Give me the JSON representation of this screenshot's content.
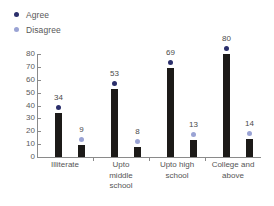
{
  "chart_data": {
    "type": "bar",
    "title": "",
    "subtitle": "",
    "xlabel": "",
    "ylabel": "",
    "ylim": [
      0,
      80
    ],
    "yticks": [
      0,
      10,
      20,
      30,
      40,
      50,
      60,
      70,
      80
    ],
    "grid": false,
    "legend_position": "top-left",
    "categories": [
      "Illiterate",
      "Upto\nmiddle\nschool",
      "Upto high\nschool",
      "College and\nabove"
    ],
    "series": [
      {
        "name": "Agree",
        "color": "#2b2f6b",
        "values": [
          34,
          53,
          69,
          80
        ]
      },
      {
        "name": "Disagree",
        "color": "#9aa3d4",
        "values": [
          9,
          8,
          13,
          14
        ]
      }
    ],
    "bar_color": "#1c1a18",
    "axis_color": "#8a8a8a"
  },
  "legend": {
    "items": [
      {
        "label": "Agree",
        "color": "#2b2f6b"
      },
      {
        "label": "Disagree",
        "color": "#9aa3d4"
      }
    ]
  }
}
